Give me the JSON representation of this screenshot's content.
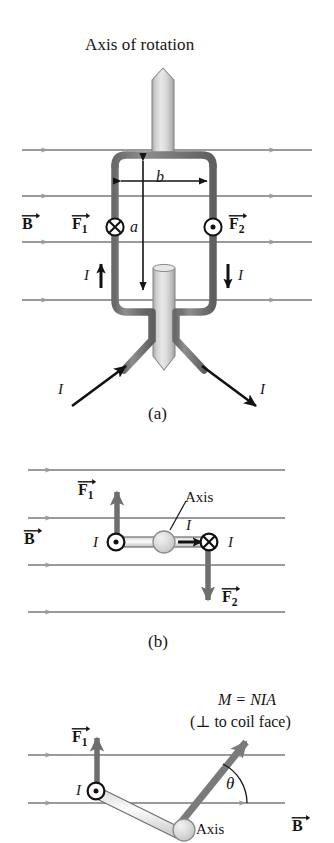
{
  "figure": {
    "title": "Axis of rotation",
    "background_color": "#ffffff",
    "field_line_color": "#9a9a9a",
    "wire_color": "#757575",
    "shaft_color": "#d5d5d5",
    "text_color": "#151515"
  },
  "panel_a": {
    "tag": "(a)",
    "title": "Axis of rotation",
    "b_field_label": "B",
    "force_left_label": "F",
    "force_left_sub": "1",
    "force_right_label": "F",
    "force_right_sub": "2",
    "width_dim_label": "b",
    "height_dim_label": "a",
    "current_left_label": "I",
    "current_right_label": "I",
    "current_lead_left_label": "I",
    "current_lead_right_label": "I",
    "into_page_symbol": "cross-in-circle",
    "out_of_page_symbol": "dot-in-circle",
    "axis_shaft_name": "rotation-axis-shaft"
  },
  "panel_b": {
    "tag": "(b)",
    "b_field_label": "B",
    "force_up_label": "F",
    "force_up_sub": "1",
    "force_down_label": "F",
    "force_down_sub": "2",
    "axis_label": "Axis",
    "current_left_label": "I",
    "current_mid_label": "I",
    "current_right_label": "I",
    "out_of_page_symbol": "dot-in-circle",
    "into_page_symbol": "cross-in-circle"
  },
  "panel_c": {
    "moment_label": "M = NIA",
    "moment_note": "(⊥ to coil face)",
    "force_up_label": "F",
    "force_up_sub": "1",
    "angle_label": "θ",
    "axis_label": "Axis",
    "b_field_label": "B",
    "current_left_label": "I",
    "out_of_page_symbol": "dot-in-circle"
  }
}
